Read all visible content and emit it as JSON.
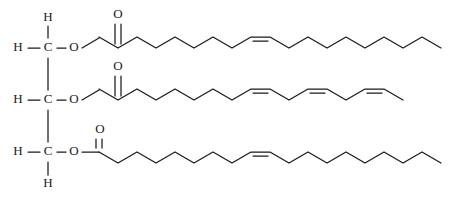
{
  "diagram": {
    "backbone_name": "glycerol",
    "colors": {
      "bond": "#1a1a1a",
      "atom_label": "#1a1a1a",
      "background": "#ffffff"
    },
    "atoms": {
      "carbon": "C",
      "hydrogen": "H",
      "oxygen": "O"
    },
    "backbone": {
      "carbon_1": {
        "label": "C",
        "x": 48,
        "y": 48
      },
      "carbon_2": {
        "label": "C",
        "x": 48,
        "y": 100
      },
      "carbon_3": {
        "label": "C",
        "x": 48,
        "y": 152
      },
      "hydrogens": [
        {
          "label": "H",
          "x": 18,
          "y": 48
        },
        {
          "label": "H",
          "x": 48,
          "y": 18
        },
        {
          "label": "H",
          "x": 18,
          "y": 100
        },
        {
          "label": "H",
          "x": 18,
          "y": 152
        },
        {
          "label": "H",
          "x": 48,
          "y": 184
        }
      ],
      "ester_oxygens": [
        {
          "label": "O",
          "x": 74,
          "y": 48
        },
        {
          "label": "O",
          "x": 74,
          "y": 100
        },
        {
          "label": "O",
          "x": 74,
          "y": 152
        }
      ]
    },
    "carbonyl_oxygens": [
      {
        "label": "O",
        "x": 118,
        "y": 15
      },
      {
        "label": "O",
        "x": 118,
        "y": 67
      },
      {
        "label": "O",
        "x": 100,
        "y": 130
      }
    ],
    "chains": [
      {
        "name": "oleate-chain-top",
        "acyl_group": "oleoyl",
        "double_bonds": 1,
        "geometry": "cis",
        "vertices": "99,37 118,48 137,37 156,48 175,37 194,48 213,37 232,48 251,37 270,37 289,48 308,37 327,48 346,37 365,48 384,37 403,48 422,37 441,48",
        "double_bond_segment": "251,41 270,41"
      },
      {
        "name": "linolenate-chain-middle",
        "acyl_group": "linolenoyl",
        "double_bonds": 3,
        "geometry": "cis,cis,cis",
        "vertices": "99,89 118,100 137,89 156,100 175,89 194,100 213,89 232,100 251,89 270,89 289,100 308,89 327,89 346,100 365,89 384,89 403,100",
        "double_bond_segments": [
          "251,93 270,93",
          "308,93 327,93",
          "365,93 384,93"
        ]
      },
      {
        "name": "oleate-chain-bottom",
        "acyl_group": "oleoyl",
        "double_bonds": 1,
        "geometry": "cis",
        "vertices": "99,152 118,163 137,152 156,163 175,152 194,163 213,152 232,163 251,152 270,152 289,163 308,152 327,163 346,152 365,163 384,152 403,163 422,152 441,163",
        "double_bond_segment": "251,156 270,156"
      }
    ]
  }
}
